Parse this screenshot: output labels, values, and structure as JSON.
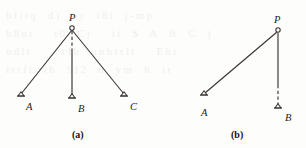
{
  "page": {
    "width": 306,
    "height": 148,
    "background_color": "#fdfdfc",
    "ink_color": "#3a3430",
    "label_color": "#1e1a18",
    "bleed_through_text": "bfiiq d) by i8i j-mp\nb8oi  i0 Cj  ii $ A B C j\nodlt   rfh unhrrlt  Ehi\nirrfi ih 9f2 n ym h ir"
  },
  "figures": [
    {
      "id": "figure-a",
      "caption": "(a)",
      "caption_x": 72,
      "caption_y": 130,
      "points": [
        {
          "id": "P",
          "label": "P",
          "marker": "circle",
          "x": 72,
          "y": 28,
          "label_x": 69,
          "label_y": 13
        },
        {
          "id": "A",
          "label": "A",
          "marker": "triangle",
          "x": 21,
          "y": 96,
          "label_x": 26,
          "label_y": 102
        },
        {
          "id": "B",
          "label": "B",
          "marker": "triangle",
          "x": 72,
          "y": 98,
          "label_x": 78,
          "label_y": 104
        },
        {
          "id": "C",
          "label": "C",
          "marker": "triangle",
          "x": 124,
          "y": 96,
          "label_x": 130,
          "label_y": 102
        }
      ],
      "segments": [
        {
          "id": "P-A",
          "from": "P",
          "to": "A",
          "style": "solid",
          "x1": 72,
          "y1": 30,
          "x2": 21,
          "y2": 94
        },
        {
          "id": "P-C",
          "from": "P",
          "to": "C",
          "style": "solid",
          "x1": 72,
          "y1": 30,
          "x2": 124,
          "y2": 94
        },
        {
          "id": "P-B-dashed",
          "from": "P",
          "to": "B",
          "style": "dashed",
          "x1": 72,
          "y1": 31,
          "x2": 72,
          "y2": 51
        },
        {
          "id": "P-B-solid",
          "from": "P",
          "to": "B",
          "style": "solid",
          "x1": 72,
          "y1": 51,
          "x2": 72,
          "y2": 96
        }
      ]
    },
    {
      "id": "figure-b",
      "caption": "(b)",
      "caption_x": 231,
      "caption_y": 130,
      "points": [
        {
          "id": "P",
          "label": "P",
          "marker": "circle",
          "x": 278,
          "y": 30,
          "label_x": 274,
          "label_y": 15
        },
        {
          "id": "A",
          "label": "A",
          "marker": "triangle",
          "x": 204,
          "y": 95,
          "label_x": 201,
          "label_y": 108
        },
        {
          "id": "B",
          "label": "B",
          "marker": "triangle",
          "x": 278,
          "y": 108,
          "label_x": 285,
          "label_y": 113
        }
      ],
      "segments": [
        {
          "id": "P-A",
          "from": "P",
          "to": "A",
          "style": "solid",
          "x1": 277,
          "y1": 32,
          "x2": 205,
          "y2": 93
        },
        {
          "id": "P-B-solid",
          "from": "P",
          "to": "B",
          "style": "solid",
          "x1": 278,
          "y1": 33,
          "x2": 278,
          "y2": 85
        },
        {
          "id": "P-B-dashed",
          "from": "P",
          "to": "B",
          "style": "dashed",
          "x1": 278,
          "y1": 85,
          "x2": 278,
          "y2": 106
        }
      ]
    }
  ]
}
